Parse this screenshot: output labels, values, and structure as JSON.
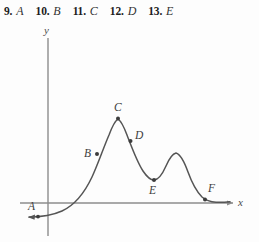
{
  "exercises": [
    {
      "number": "9.",
      "label": "A"
    },
    {
      "number": "10.",
      "label": "B"
    },
    {
      "number": "11.",
      "label": "C"
    },
    {
      "number": "12.",
      "label": "D"
    },
    {
      "number": "13.",
      "label": "E"
    }
  ],
  "figure": {
    "axes": {
      "x_label": "x",
      "y_label": "y"
    },
    "points": [
      {
        "id": "A",
        "label": "A"
      },
      {
        "id": "B",
        "label": "B"
      },
      {
        "id": "C",
        "label": "C"
      },
      {
        "id": "D",
        "label": "D"
      },
      {
        "id": "E",
        "label": "E"
      },
      {
        "id": "F",
        "label": "F"
      }
    ]
  },
  "colors": {
    "curve": "#555555",
    "axis": "#8c8c8c",
    "text": "#333333",
    "background": "#fdfdfd"
  }
}
